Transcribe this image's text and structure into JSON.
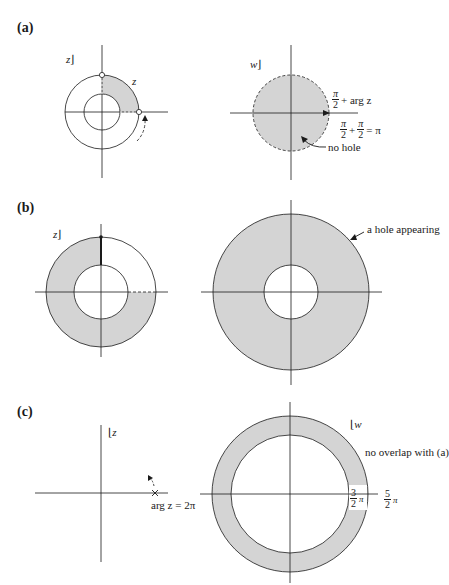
{
  "colors": {
    "fill": "#d4d4d4",
    "stroke": "#1a1a1a",
    "background": "#ffffff"
  },
  "panels": {
    "a": {
      "label": "(a)",
      "left_plane_label": "z",
      "left_point_label": "z",
      "right_plane_label": "w",
      "eq1": {
        "num": "π",
        "den": "2",
        "rest": "+ arg z"
      },
      "eq2": {
        "num1": "π",
        "den1": "2",
        "plus": "+",
        "num2": "π",
        "den2": "2",
        "rest": "= π"
      },
      "annotation": "no hole"
    },
    "b": {
      "label": "(b)",
      "left_plane_label": "z",
      "annotation": "a hole appearing"
    },
    "c": {
      "label": "(c)",
      "left_plane_label": "z",
      "left_point_label": "arg z = 2π",
      "right_plane_label": "w",
      "annotation": "no overlap with (a)",
      "inner_angle": {
        "num": "3",
        "den": "2",
        "pi": "π"
      },
      "outer_angle": {
        "num": "5",
        "den": "2",
        "pi": "π"
      }
    }
  }
}
